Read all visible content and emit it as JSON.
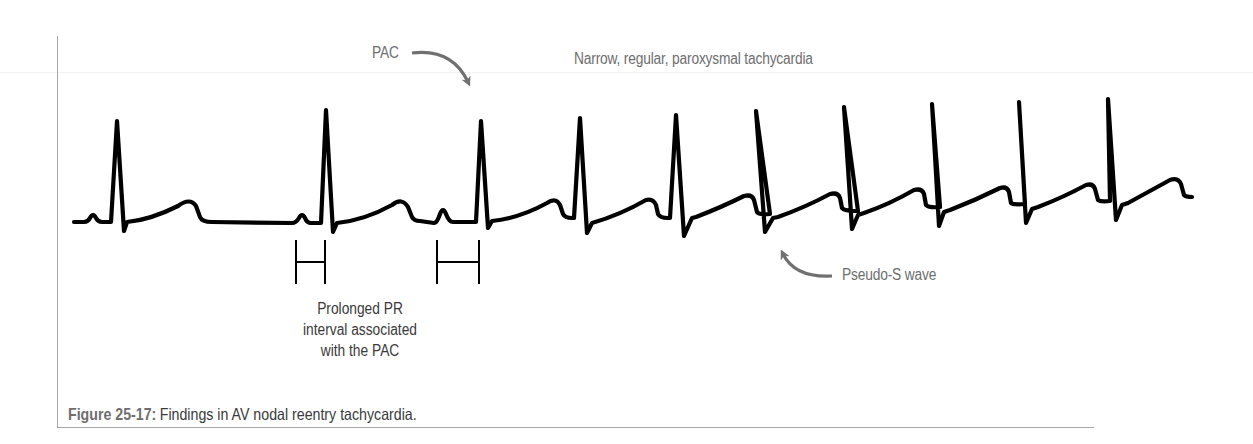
{
  "figure": {
    "number_label": "Figure 25-17:",
    "caption_text": "Findings in AV nodal reentry tachycardia."
  },
  "annotations": {
    "pac": "PAC",
    "tachycardia": "Narrow, regular, paroxysmal tachycardia",
    "pseudo_s": "Pseudo-S wave",
    "prolonged_pr": [
      "Prolonged PR",
      "interval associated",
      "with the PAC"
    ]
  },
  "colors": {
    "trace": "#000000",
    "annotation_text": "#6e6e6e",
    "arrow": "#707070",
    "frame": "#a8a8a8"
  },
  "ecg": {
    "description": "ECG rhythm strip: two normal sinus beats, then a premature atrial contraction (PAC) with a prolonged PR interval triggering a narrow, regular, paroxysmal tachycardia with pseudo-S waves",
    "total_qrs_complexes": 12,
    "sinus_beats": 2,
    "pac_beat_index": 3,
    "tachycardia_beats": 9,
    "pr_interval_markers": [
      {
        "label": "normal PR",
        "x_start": 296,
        "x_end": 325
      },
      {
        "label": "prolonged PR (PAC)",
        "x_start": 437,
        "x_end": 479
      }
    ]
  }
}
